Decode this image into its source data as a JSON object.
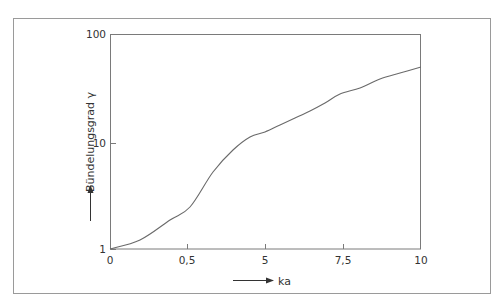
{
  "chart_data": {
    "type": "line",
    "title": "",
    "xlabel": "ka",
    "ylabel": "Bündelungsgrad γ",
    "yscale": "log",
    "ylim": [
      1,
      100
    ],
    "x_tick_labels": [
      "0",
      "0,5",
      "5",
      "7,5",
      "10"
    ],
    "y_tick_labels": [
      "1",
      "10",
      "100"
    ],
    "grid": false,
    "legend": null,
    "series": [
      {
        "name": "Bündelungsgrad",
        "x": [
          0,
          0.19,
          0.39,
          0.52,
          0.67,
          0.79,
          0.91,
          1.0,
          1.13,
          1.29,
          1.48,
          1.67,
          1.87,
          2.13,
          2.42,
          2.75,
          3.0
        ],
        "y": [
          1.0,
          1.2,
          1.6,
          2.3,
          3.2,
          4.6,
          6.5,
          8.6,
          10.3,
          12.0,
          14.0,
          17.0,
          21.0,
          25.0,
          31.0,
          40.0,
          51.0
        ]
      }
    ],
    "x_positions_note": "x tick spacing is uniform on screen between labels 0, 0,5, 5, 7,5, 10",
    "x_screen": [
      110,
      140,
      170,
      190,
      213,
      233,
      250,
      265,
      280,
      295,
      310,
      325,
      340,
      360,
      380,
      400,
      421
    ],
    "y_screen": [
      249,
      240,
      220,
      207,
      172,
      150,
      137,
      132,
      125,
      118,
      111,
      103,
      94,
      88,
      79,
      73,
      67
    ]
  },
  "axes": {
    "x": {
      "label": "ka",
      "ticks": [
        {
          "label": "0",
          "px": 110
        },
        {
          "label": "0,5",
          "px": 187
        },
        {
          "label": "5",
          "px": 265
        },
        {
          "label": "7,5",
          "px": 343
        },
        {
          "label": "10",
          "px": 421
        }
      ]
    },
    "y": {
      "label": "Bündelungsgrad γ",
      "ticks": [
        {
          "label": "1",
          "py": 249
        },
        {
          "label": "10",
          "py": 143
        },
        {
          "label": "100",
          "py": 34
        }
      ]
    }
  }
}
